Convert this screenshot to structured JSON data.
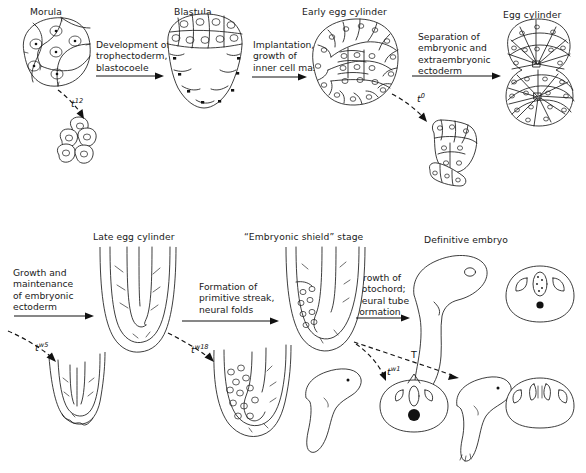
{
  "figure": {
    "title_implicit": "Mouse embryonic development and t-complex mutant arrest points",
    "stages_top": [
      {
        "id": "morula",
        "label": "Morula"
      },
      {
        "id": "blastula",
        "label": "Blastula"
      },
      {
        "id": "early-egg-cylinder",
        "label": "Early egg cylinder"
      },
      {
        "id": "egg-cylinder",
        "label": "Egg cylinder"
      }
    ],
    "stages_bottom": [
      {
        "id": "late-egg-cylinder",
        "label": "Late egg cylinder"
      },
      {
        "id": "embryonic-shield",
        "label": "“Embryonic shield” stage"
      },
      {
        "id": "definitive-embryo",
        "label": "Definitive embryo"
      }
    ],
    "processes_top": [
      {
        "id": "p1",
        "lines": [
          "Development of",
          "trophectoderm,",
          "blastocoele"
        ]
      },
      {
        "id": "p2",
        "lines": [
          "Implantation,",
          "growth of",
          "inner cell mass"
        ]
      },
      {
        "id": "p3",
        "lines": [
          "Separation of",
          "embryonic and",
          "extraembryonic",
          "ectoderm"
        ]
      }
    ],
    "processes_bottom": [
      {
        "id": "p4",
        "lines": [
          "Growth and",
          "maintenance",
          "of embryonic",
          "ectoderm"
        ]
      },
      {
        "id": "p5",
        "lines": [
          "Formation of",
          "primitive streak,",
          "neural folds"
        ]
      },
      {
        "id": "p6",
        "lines": [
          "Growth of",
          "notochord;",
          "neural tube",
          "formation"
        ]
      }
    ],
    "mutants": [
      {
        "id": "t12",
        "gene": "t",
        "superscript": "12"
      },
      {
        "id": "t0",
        "gene": "t",
        "superscript": "0"
      },
      {
        "id": "tw5",
        "gene": "t",
        "superscript": "w5"
      },
      {
        "id": "tw18",
        "gene": "t",
        "superscript": "w18"
      },
      {
        "id": "tw1",
        "gene": "t",
        "superscript": "w1"
      },
      {
        "id": "T",
        "gene": "T",
        "superscript": ""
      }
    ],
    "colors": {
      "ink": "#1b1b1b",
      "background": "#ffffff",
      "fill": "#ffffff",
      "node_dot": "#111111"
    }
  }
}
